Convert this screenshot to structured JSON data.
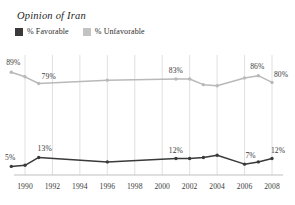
{
  "chart_data": {
    "type": "line",
    "title": "Opinion of Iran",
    "xlabel": "",
    "ylabel": "",
    "xlim": [
      1989,
      2008
    ],
    "ylim": [
      0,
      100
    ],
    "grid": "vertical",
    "legend_position": "top-left",
    "x_ticks": [
      "1990",
      "1992",
      "1994",
      "1996",
      "1998",
      "2000",
      "2002",
      "2004",
      "2006",
      "2008"
    ],
    "series": [
      {
        "name": "% Favorable",
        "color": "#3a3a3a",
        "x": [
          1989,
          1990,
          1991,
          1996,
          2001,
          2002,
          2003,
          2004,
          2006,
          2007,
          2008
        ],
        "values": [
          5,
          6,
          13,
          9,
          12,
          12,
          13,
          15,
          7,
          9,
          12
        ],
        "point_labels": [
          {
            "x": 1989,
            "value": 5,
            "text": "5%"
          },
          {
            "x": 1991,
            "value": 13,
            "text": "13%"
          },
          {
            "x": 2001,
            "value": 12,
            "text": "12%"
          },
          {
            "x": 2006,
            "value": 7,
            "text": "7%"
          },
          {
            "x": 2008,
            "value": 12,
            "text": "12%"
          }
        ]
      },
      {
        "name": "% Unfavorable",
        "color": "#b9b9b9",
        "x": [
          1989,
          1990,
          1991,
          1996,
          2001,
          2002,
          2003,
          2004,
          2006,
          2007,
          2008
        ],
        "values": [
          89,
          85,
          79,
          82,
          83,
          83,
          78,
          77,
          84,
          86,
          80
        ],
        "point_labels": [
          {
            "x": 1989,
            "value": 89,
            "text": "89%"
          },
          {
            "x": 1991,
            "value": 79,
            "text": "79%"
          },
          {
            "x": 2001,
            "value": 83,
            "text": "83%"
          },
          {
            "x": 2007,
            "value": 86,
            "text": "86%"
          },
          {
            "x": 2008,
            "value": 80,
            "text": "80%"
          }
        ]
      }
    ]
  },
  "legend": {
    "items": [
      {
        "label": "% Favorable",
        "color": "#3a3a3a"
      },
      {
        "label": "% Unfavorable",
        "color": "#c3c3c3"
      }
    ]
  },
  "colors": {
    "favorable": "#3a3a3a",
    "unfavorable": "#b9b9b9",
    "gridline": "#d8d8d8",
    "axis": "#b0b0b0",
    "text": "#3a3a3a",
    "background": "#ffffff"
  }
}
